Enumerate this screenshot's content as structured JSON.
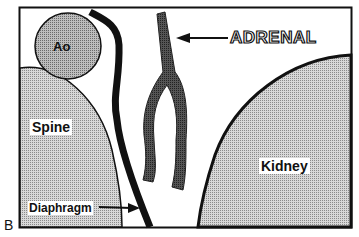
{
  "panel_letter": "B",
  "labels": {
    "aorta": "Ao",
    "adrenal": "ADRENAL",
    "spine": "Spine",
    "kidney": "Kidney",
    "diaphragm": "Diaphragm"
  },
  "colors": {
    "outline": "#111111",
    "fill_gray": "#a9a9a9",
    "fill_light": "#c8c8c8",
    "adrenal_fill": "#3a3a3a"
  }
}
